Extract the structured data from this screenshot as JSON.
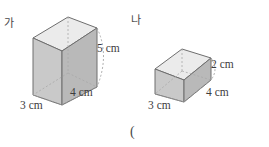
{
  "page": {
    "background": "#ffffff",
    "width": 269,
    "height": 147
  },
  "colors": {
    "front_face": "#c9c9c9",
    "side_face": "#b4b4b4",
    "top_face": "#ebebeb",
    "edge": "#6e6e6e",
    "hidden_edge": "#a8a8a8",
    "text": "#3d3d3d"
  },
  "figures": [
    {
      "id": "figure-ga",
      "label": "가",
      "shape": "rectangular-prism",
      "dimensions": [
        {
          "name": "height",
          "text": "5 cm",
          "value": 5,
          "unit": "cm"
        },
        {
          "name": "depth",
          "text": "4 cm",
          "value": 4,
          "unit": "cm"
        },
        {
          "name": "width",
          "text": "3 cm",
          "value": 3,
          "unit": "cm"
        }
      ]
    },
    {
      "id": "figure-na",
      "label": "나",
      "shape": "rectangular-prism",
      "dimensions": [
        {
          "name": "height",
          "text": "2 cm",
          "value": 2,
          "unit": "cm"
        },
        {
          "name": "depth",
          "text": "4 cm",
          "value": 4,
          "unit": "cm"
        },
        {
          "name": "width",
          "text": "3 cm",
          "value": 3,
          "unit": "cm"
        }
      ]
    }
  ],
  "answer_field": {
    "text": "("
  }
}
